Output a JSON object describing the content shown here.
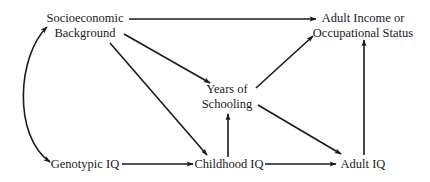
{
  "diagram": {
    "type": "path-diagram",
    "nodes": {
      "socio": {
        "line1": "Socioeconomic",
        "line2": "Background"
      },
      "income": {
        "line1": "Adult Income or",
        "line2": "Occupational Status"
      },
      "schooling": {
        "line1": "Years of",
        "line2": "Schooling"
      },
      "genotypic": {
        "label": "Genotypic IQ"
      },
      "childhood": {
        "label": "Childhood IQ"
      },
      "adult_iq": {
        "label": "Adult IQ"
      }
    },
    "edges": [
      {
        "from": "Socioeconomic Background",
        "to": "Adult Income or Occupational Status",
        "type": "directed"
      },
      {
        "from": "Socioeconomic Background",
        "to": "Years of Schooling",
        "type": "directed"
      },
      {
        "from": "Socioeconomic Background",
        "to": "Childhood IQ",
        "type": "directed"
      },
      {
        "from": "Socioeconomic Background",
        "to": "Genotypic IQ",
        "type": "bidirectional-curved"
      },
      {
        "from": "Genotypic IQ",
        "to": "Childhood IQ",
        "type": "directed"
      },
      {
        "from": "Childhood IQ",
        "to": "Years of Schooling",
        "type": "directed"
      },
      {
        "from": "Childhood IQ",
        "to": "Adult IQ",
        "type": "directed"
      },
      {
        "from": "Years of Schooling",
        "to": "Adult IQ",
        "type": "directed"
      },
      {
        "from": "Years of Schooling",
        "to": "Adult Income or Occupational Status",
        "type": "directed"
      },
      {
        "from": "Adult IQ",
        "to": "Adult Income or Occupational Status",
        "type": "directed"
      }
    ],
    "colors": {
      "line": "#1a1a1a",
      "background": "#ffffff"
    }
  }
}
